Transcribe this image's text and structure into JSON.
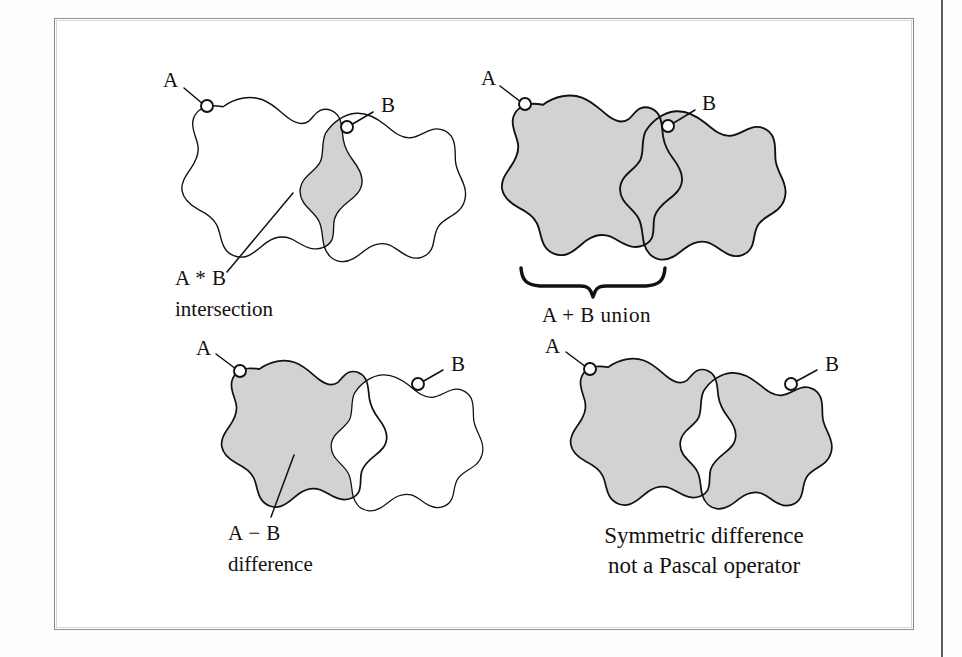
{
  "figure": {
    "title_visible": false,
    "background_color": "#ffffff",
    "frame_color": "#8d8d8d",
    "ink_color": "#13100e",
    "shade_color": "#d2d2d2",
    "page_rule_color": "#5d5d5d"
  },
  "panels": [
    {
      "id": "intersection",
      "set_a_label": "A",
      "set_b_label": "B",
      "operation_label": "A * B",
      "operation_name": "intersection",
      "shaded_region": "A and B overlap only"
    },
    {
      "id": "union",
      "set_a_label": "A",
      "set_b_label": "B",
      "operation_label": "A + B union",
      "operation_name": "",
      "shaded_region": "all of A and all of B"
    },
    {
      "id": "difference",
      "set_a_label": "A",
      "set_b_label": "B",
      "operation_label": "A − B",
      "operation_name": "difference",
      "shaded_region": "A minus the overlap"
    },
    {
      "id": "symmetric-difference",
      "set_a_label": "A",
      "set_b_label": "B",
      "operation_label": "Symmetric difference",
      "operation_name": "not a Pascal operator",
      "shaded_region": "A and B excluding the overlap"
    }
  ]
}
